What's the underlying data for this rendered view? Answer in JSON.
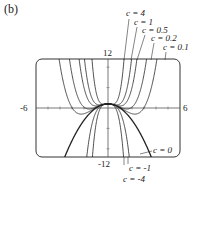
{
  "figure": {
    "panel_label": "(b)",
    "axes": {
      "x_min_label": "-6",
      "x_max_label": "6",
      "y_max_label": "12",
      "y_min_label": "-12"
    },
    "curve_labels": {
      "top": [
        "c = 4",
        "c = 1",
        "c = 0.5",
        "c = 0.2",
        "c = 0.1"
      ],
      "zero": "c = 0",
      "bottom": [
        "c = -1",
        "c = -4"
      ]
    },
    "function": "f(x) = c x^4 - x^2 + 1",
    "c_values": [
      4,
      1,
      0.5,
      0.2,
      0.1,
      0,
      -1,
      -4
    ],
    "window": {
      "xmin": -6,
      "xmax": 6,
      "ymin": -12,
      "ymax": 12
    }
  }
}
